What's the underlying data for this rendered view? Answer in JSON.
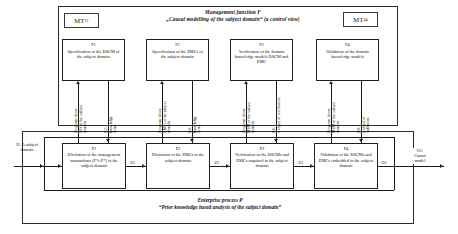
{
  "diagram": {
    "management_frame": {
      "title_line1": "Management function F",
      "title_line2": "„Causal modelling of the subject domain“ (a control view)",
      "mt_left": "MT",
      "mt_left_sub": "11",
      "mt_right": "MT",
      "mt_right_sub": "44",
      "functions": [
        {
          "code": "F1",
          "text": "Specification of the DSCM of the subject domain"
        },
        {
          "code": "F2",
          "text": "Specification of the EMCs of the subject domain"
        },
        {
          "code": "F3",
          "text": "Verification of the domain knowledge models DSCM and EMC"
        },
        {
          "code": "F4",
          "text": "Validation of the domain knowledge models"
        }
      ]
    },
    "enterprise_frame": {
      "title_line1": "Enterprise process P",
      "title_line2": "“Prior knowledge based analysis of the subject domain”",
      "processes": [
        {
          "code": "P1",
          "text": "Elicitation of the management transactions (F*s P*) in the subject domain"
        },
        {
          "code": "P2",
          "text": "Elicitation of the EMCs in the subject domain"
        },
        {
          "code": "P3",
          "text": "Verification of the DSCMs and EMCs acquired in the subject domain"
        },
        {
          "code": "P4",
          "text": "Validation of the DSCMs and EMCs embedded in the subject domain"
        }
      ]
    },
    "vertical_labels": [
      {
        "line1": "Response about",
        "line2": "BFs of the subject",
        "line3": "domain"
      },
      {
        "line1": "K2:",
        "line2": "knowledge",
        "line3": "items"
      },
      {
        "line1": "Response about",
        "line2": "EMCs of the subject",
        "line3": "domain"
      },
      {
        "line1": "K4:",
        "line2": "knowledge",
        "line3": "items"
      },
      {
        "line1": "Response about",
        "line2": "MEM of the subject",
        "line3": "domain"
      },
      {
        "line1": "K6:",
        "line2": "a object of verification"
      },
      {
        "line1": "Response about",
        "line2": "MEM of the subject",
        "line3": "domain"
      },
      {
        "line1": "K8:",
        "line2": "a object of",
        "line3": "validation"
      }
    ],
    "flow_labels": {
      "input": {
        "line1": "I1: A subject",
        "line2": "domain"
      },
      "z1": "Z1",
      "z2": "Z2",
      "z3": "Z3",
      "o1": "O1",
      "output": {
        "line1": "O1:",
        "line2": "Causal",
        "line3": "model"
      }
    }
  }
}
